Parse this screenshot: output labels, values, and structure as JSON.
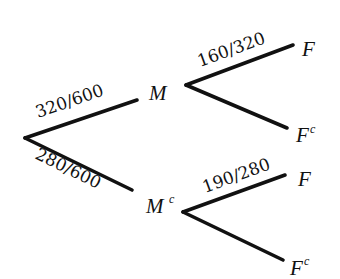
{
  "diagram": {
    "type": "probability-tree",
    "root": {
      "branches": [
        {
          "node_label": "M",
          "node_sup": "",
          "probability": "320/600",
          "children": [
            {
              "node_label": "F",
              "node_sup": "",
              "probability": "160/320"
            },
            {
              "node_label": "F",
              "node_sup": "c",
              "probability": ""
            }
          ]
        },
        {
          "node_label": "M",
          "node_sup": "c",
          "probability": "280/600",
          "children": [
            {
              "node_label": "F",
              "node_sup": "",
              "probability": "190/280"
            },
            {
              "node_label": "F",
              "node_sup": "c",
              "probability": ""
            }
          ]
        }
      ]
    }
  }
}
